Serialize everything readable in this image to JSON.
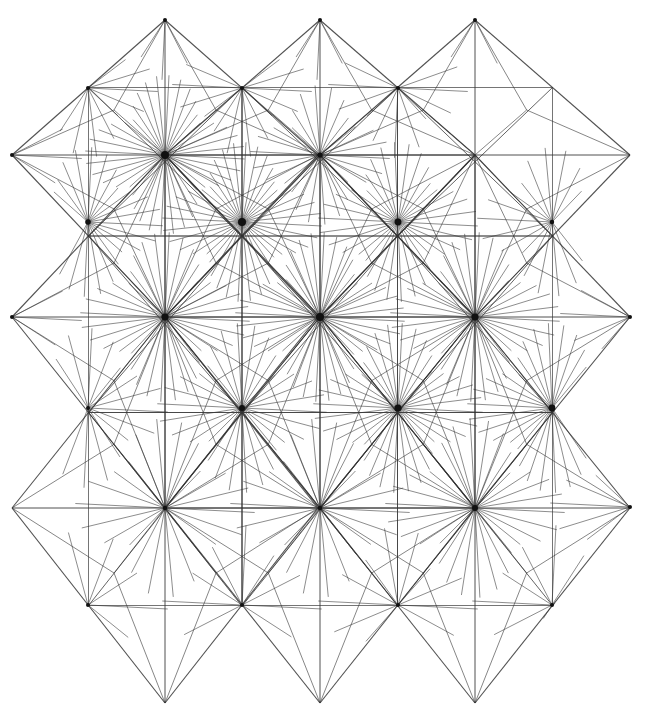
{
  "diagram": {
    "caption_clipped": "",
    "stroke_color": "#333333",
    "background": "#ffffff",
    "columns_x": [
      12,
      88,
      165,
      242,
      320,
      398,
      475,
      552,
      630
    ],
    "rows_y": [
      20,
      88,
      155,
      222,
      317,
      410,
      508,
      605,
      703
    ],
    "diamonds": [
      {
        "cx": 165,
        "cy": 155,
        "rx": 153,
        "top": 20,
        "bottom": 317
      },
      {
        "cx": 320,
        "cy": 155,
        "rx": 155,
        "top": 20,
        "bottom": 317
      },
      {
        "cx": 475,
        "cy": 155,
        "rx": 155,
        "top": 20,
        "bottom": 317
      },
      {
        "cx": 165,
        "cy": 317,
        "rx": 153,
        "top": 155,
        "bottom": 508
      },
      {
        "cx": 320,
        "cy": 317,
        "rx": 155,
        "top": 155,
        "bottom": 508
      },
      {
        "cx": 475,
        "cy": 317,
        "rx": 155,
        "top": 155,
        "bottom": 508
      },
      {
        "cx": 165,
        "cy": 508,
        "rx": 153,
        "top": 317,
        "bottom": 703
      },
      {
        "cx": 320,
        "cy": 508,
        "rx": 155,
        "top": 317,
        "bottom": 703
      },
      {
        "cx": 475,
        "cy": 508,
        "rx": 155,
        "top": 317,
        "bottom": 703
      }
    ],
    "hubs": [
      {
        "x": 165,
        "y": 155,
        "rays": 40,
        "r": 80
      },
      {
        "x": 242,
        "y": 222,
        "rays": 40,
        "r": 80
      },
      {
        "x": 88,
        "y": 222,
        "rays": 28,
        "r": 75
      },
      {
        "x": 320,
        "y": 317,
        "rays": 40,
        "r": 85
      },
      {
        "x": 165,
        "y": 317,
        "rays": 36,
        "r": 85
      },
      {
        "x": 398,
        "y": 222,
        "rays": 34,
        "r": 80
      },
      {
        "x": 475,
        "y": 317,
        "rays": 36,
        "r": 85
      },
      {
        "x": 398,
        "y": 408,
        "rays": 36,
        "r": 85
      },
      {
        "x": 552,
        "y": 408,
        "rays": 34,
        "r": 85
      },
      {
        "x": 242,
        "y": 408,
        "rays": 30,
        "r": 85
      },
      {
        "x": 475,
        "y": 508,
        "rays": 30,
        "r": 90
      },
      {
        "x": 320,
        "y": 155,
        "rays": 26,
        "r": 70
      },
      {
        "x": 165,
        "y": 508,
        "rays": 22,
        "r": 90
      },
      {
        "x": 320,
        "y": 508,
        "rays": 22,
        "r": 90
      },
      {
        "x": 88,
        "y": 408,
        "rays": 20,
        "r": 80
      },
      {
        "x": 630,
        "y": 507,
        "rays": 18,
        "r": 80
      },
      {
        "x": 242,
        "y": 88,
        "rays": 18,
        "r": 70
      },
      {
        "x": 88,
        "y": 88,
        "rays": 18,
        "r": 70
      },
      {
        "x": 398,
        "y": 88,
        "rays": 16,
        "r": 70
      },
      {
        "x": 165,
        "y": 20,
        "rays": 12,
        "r": 60
      },
      {
        "x": 320,
        "y": 20,
        "rays": 12,
        "r": 60
      },
      {
        "x": 475,
        "y": 20,
        "rays": 6,
        "r": 60
      },
      {
        "x": 552,
        "y": 222,
        "rays": 22,
        "r": 75
      },
      {
        "x": 12,
        "y": 155,
        "rays": 12,
        "r": 70
      },
      {
        "x": 12,
        "y": 317,
        "rays": 12,
        "r": 70
      },
      {
        "x": 630,
        "y": 317,
        "rays": 14,
        "r": 70
      },
      {
        "x": 552,
        "y": 605,
        "rays": 12,
        "r": 80
      },
      {
        "x": 398,
        "y": 605,
        "rays": 14,
        "r": 80
      },
      {
        "x": 242,
        "y": 605,
        "rays": 12,
        "r": 80
      },
      {
        "x": 88,
        "y": 605,
        "rays": 10,
        "r": 80
      }
    ]
  }
}
